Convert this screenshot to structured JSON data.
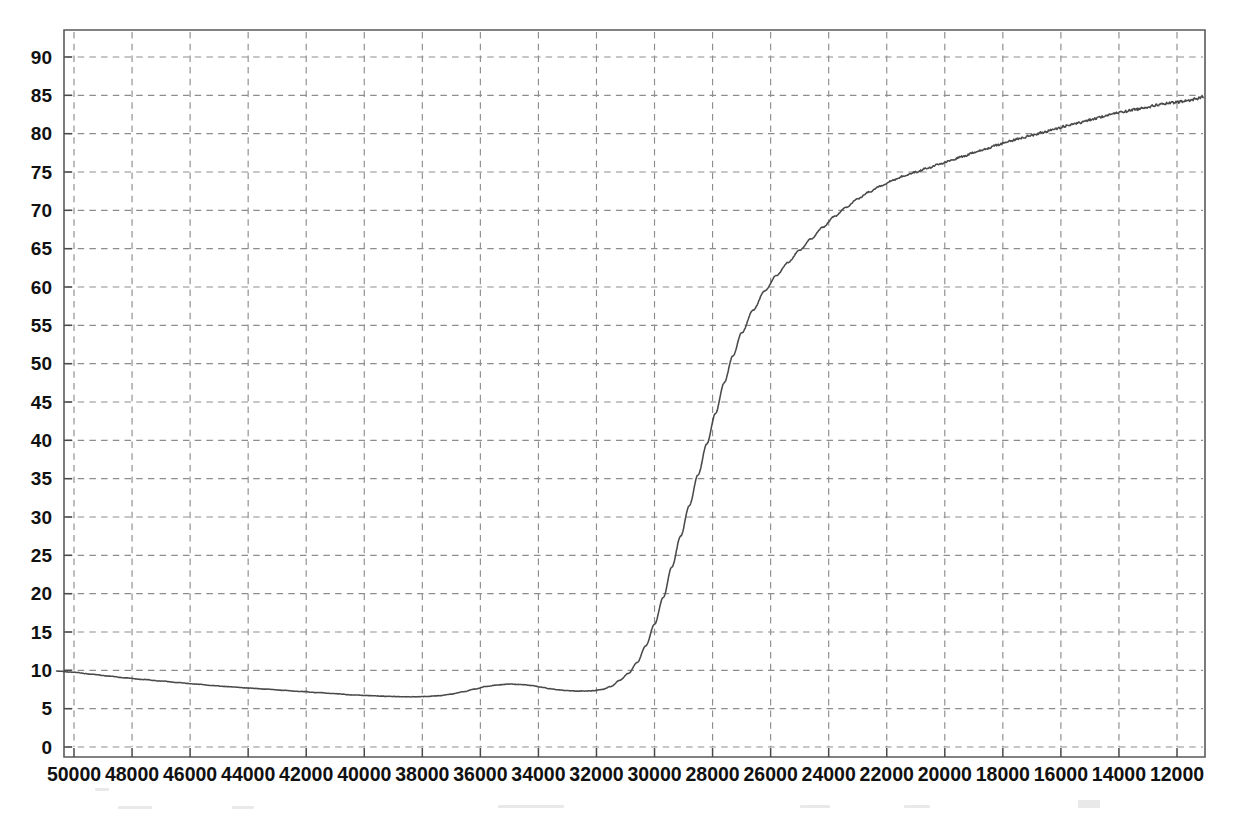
{
  "figure": {
    "title": "",
    "background_color": "#ffffff",
    "curve_color": "#4a4a4a",
    "grid_color": "#8d8d8d",
    "axis_color": "#5a5a5a"
  },
  "chart_data": {
    "type": "line",
    "title": "",
    "xlabel": "",
    "ylabel": "",
    "grid": true,
    "legend": "none",
    "x_axis_reversed": true,
    "xlim": [
      50600,
      11100
    ],
    "ylim": [
      0,
      93.5
    ],
    "xticks": [
      50000,
      48000,
      46000,
      44000,
      42000,
      40000,
      38000,
      36000,
      34000,
      32000,
      30000,
      28000,
      26000,
      24000,
      22000,
      20000,
      18000,
      16000,
      14000,
      12000
    ],
    "xtick_labels": [
      "50000",
      "48000",
      "46000",
      "44000",
      "42000",
      "40000",
      "38000",
      "36000",
      "34000",
      "32000",
      "30000",
      "28000",
      "26000",
      "24000",
      "22000",
      "20000",
      "18000",
      "16000",
      "14000",
      "12000"
    ],
    "yticks": [
      0,
      5,
      10,
      15,
      20,
      25,
      30,
      35,
      40,
      45,
      50,
      55,
      60,
      65,
      70,
      75,
      80,
      85,
      90
    ],
    "ytick_labels": [
      "0",
      "5",
      "10",
      "15",
      "20",
      "25",
      "30",
      "35",
      "40",
      "45",
      "50",
      "55",
      "60",
      "65",
      "70",
      "75",
      "80",
      "85",
      "90"
    ],
    "series": [
      {
        "name": "transmittance",
        "x": [
          50600,
          50000,
          49400,
          48800,
          48200,
          47600,
          47000,
          46400,
          45800,
          45200,
          44600,
          44000,
          43400,
          42800,
          42200,
          41600,
          41000,
          40400,
          39800,
          39200,
          38600,
          38200,
          37800,
          37400,
          37000,
          36600,
          36200,
          35800,
          35400,
          35000,
          34600,
          34200,
          33900,
          33600,
          33300,
          33000,
          32700,
          32400,
          32100,
          31800,
          31500,
          31200,
          30900,
          30600,
          30300,
          30000,
          29700,
          29400,
          29100,
          28800,
          28500,
          28200,
          27900,
          27600,
          27300,
          27000,
          26600,
          26200,
          25800,
          25400,
          25000,
          24600,
          24200,
          23800,
          23400,
          23000,
          22600,
          22200,
          21800,
          21400,
          21000,
          20600,
          20200,
          19800,
          19400,
          19000,
          18600,
          18200,
          17800,
          17400,
          17000,
          16600,
          16200,
          15800,
          15400,
          15000,
          14600,
          14200,
          13800,
          13400,
          13000,
          12600,
          12200,
          11800,
          11500,
          11300,
          11200,
          11150,
          11100
        ],
        "y": [
          9.9,
          9.75,
          9.5,
          9.25,
          9.0,
          8.8,
          8.6,
          8.4,
          8.2,
          8.0,
          7.85,
          7.7,
          7.55,
          7.4,
          7.25,
          7.1,
          6.95,
          6.8,
          6.7,
          6.6,
          6.55,
          6.55,
          6.6,
          6.7,
          6.9,
          7.2,
          7.55,
          7.9,
          8.1,
          8.2,
          8.15,
          8.0,
          7.8,
          7.6,
          7.45,
          7.35,
          7.3,
          7.3,
          7.35,
          7.5,
          7.9,
          8.7,
          9.6,
          11.0,
          13.2,
          16.0,
          19.5,
          23.5,
          27.5,
          31.5,
          35.5,
          39.5,
          43.5,
          47.5,
          51.0,
          54.0,
          57.0,
          59.5,
          61.5,
          63.2,
          64.8,
          66.3,
          67.8,
          69.2,
          70.4,
          71.5,
          72.4,
          73.2,
          73.9,
          74.5,
          75.0,
          75.5,
          76.0,
          76.5,
          77.0,
          77.5,
          78.0,
          78.5,
          79.0,
          79.4,
          79.8,
          80.2,
          80.6,
          81.0,
          81.4,
          81.8,
          82.2,
          82.6,
          82.9,
          83.2,
          83.5,
          83.8,
          84.0,
          84.2,
          84.4,
          84.6,
          84.7,
          84.8,
          84.85
        ],
        "notes": "Declining baseline near 7-10 from 50000 to 36000 with a local bump near 38000, a steep sigmoidal rise between 33000 and 28000, then an asymptotic plateau approaching 85 toward 12000."
      }
    ],
    "annotations": [
      {
        "label": "baseline-start",
        "x": 50000,
        "y": 9.8
      },
      {
        "label": "baseline-minimum",
        "x": 41600,
        "y": 6.6
      },
      {
        "label": "local-maximum",
        "x": 38000,
        "y": 8.2
      },
      {
        "label": "local-minimum",
        "x": 36200,
        "y": 7.3
      },
      {
        "label": "inflection",
        "x": 32800,
        "y": 42
      },
      {
        "label": "plateau",
        "x": 13000,
        "y": 84.9
      }
    ]
  }
}
